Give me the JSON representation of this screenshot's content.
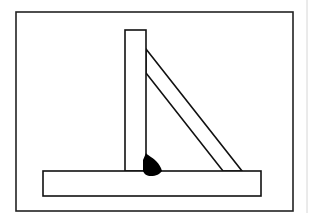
{
  "diagram": {
    "colors": {
      "background": "#ffffff",
      "stroke": "#111111",
      "weld_fill": "#000000",
      "edge_line": "#cfcfcf"
    },
    "elements": {
      "frame": {
        "x": 16,
        "y": 12,
        "w": 277,
        "h": 199
      },
      "vertical_plate": {
        "x": 125,
        "y": 30,
        "w": 21,
        "h": 141
      },
      "base_plate": {
        "x": 43,
        "y": 171,
        "w": 218,
        "h": 25
      },
      "diagonal_brace": {
        "points": "146,49 242,171 223,171 146,73"
      },
      "fillet_weld": {
        "label": "fillet weld"
      }
    }
  }
}
